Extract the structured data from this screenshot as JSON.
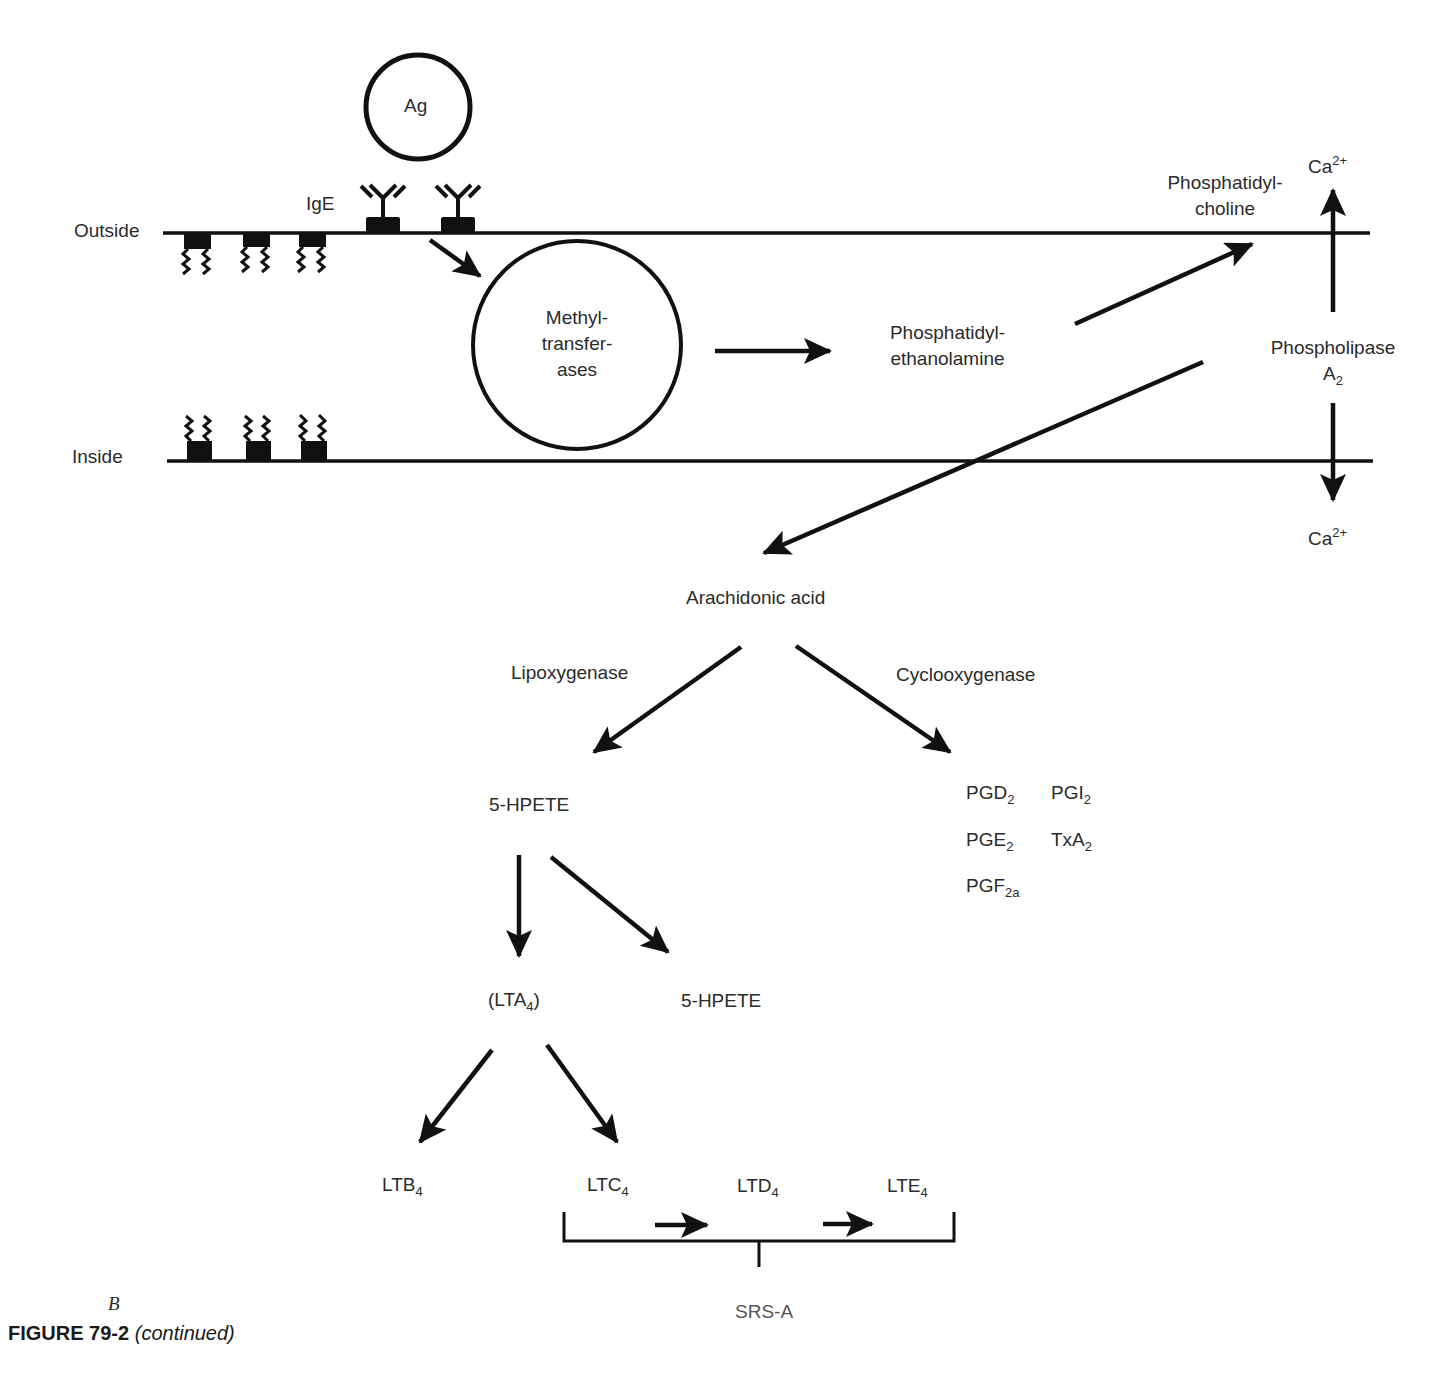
{
  "figure": {
    "panel_letter": "B",
    "caption_label": "FIGURE 79-2",
    "caption_note": "(continued)"
  },
  "membrane": {
    "outside_label": "Outside",
    "inside_label": "Inside",
    "receptor_label": "IgE",
    "antigen_label": "Ag"
  },
  "nodes": {
    "methyltransferases": [
      "Methyl-",
      "transfer-",
      "ases"
    ],
    "phosphatidylethanolamine": [
      "Phosphatidyl-",
      "ethanolamine"
    ],
    "phosphatidylcholine": [
      "Phosphatidyl-",
      "choline"
    ],
    "phospholipase": {
      "line1": "Phospholipase",
      "base": "A",
      "sub": "2"
    },
    "calcium_top": {
      "base": "Ca",
      "sup": "2+"
    },
    "calcium_bottom": {
      "base": "Ca",
      "sup": "2+"
    },
    "arachidonic_acid": "Arachidonic acid",
    "lipoxygenase": "Lipoxygenase",
    "cyclooxygenase": "Cyclooxygenase",
    "hpete_1": "5-HPETE",
    "hpete_2": "5-HPETE",
    "lta4": {
      "pre": "(LTA",
      "sub": "4",
      "post": ")"
    },
    "ltb4": {
      "base": "LTB",
      "sub": "4"
    },
    "ltc4": {
      "base": "LTC",
      "sub": "4"
    },
    "ltd4": {
      "base": "LTD",
      "sub": "4"
    },
    "lte4": {
      "base": "LTE",
      "sub": "4"
    },
    "srs_a": "SRS-A",
    "prostaglandins": [
      {
        "base": "PGD",
        "sub": "2"
      },
      {
        "base": "PGI",
        "sub": "2"
      },
      {
        "base": "PGE",
        "sub": "2"
      },
      {
        "base": "TxA",
        "sub": "2"
      },
      {
        "base": "PGF",
        "sub": "2a"
      }
    ]
  }
}
